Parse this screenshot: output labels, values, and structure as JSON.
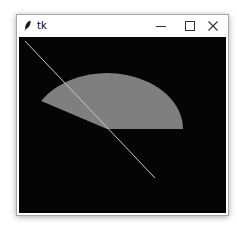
{
  "window": {
    "title": "tk",
    "icons": {
      "app": "feather-icon",
      "minimize": "minimize-icon",
      "maximize": "maximize-icon",
      "close": "close-icon"
    }
  },
  "canvas": {
    "background": "#050505",
    "shapes": [
      {
        "type": "arc",
        "style": "pieslice",
        "fill": "#7f7f7f",
        "start_deg": 0,
        "extent_deg": 150
      },
      {
        "type": "line",
        "stroke": "#c8c8c8"
      }
    ]
  }
}
